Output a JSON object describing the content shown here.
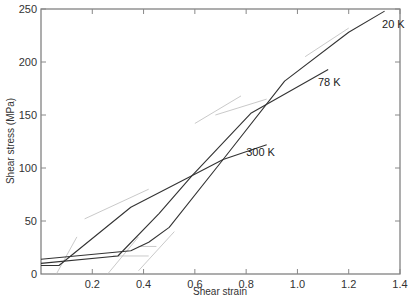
{
  "chart_data": {
    "type": "line",
    "title": "",
    "xlabel": "Shear strain",
    "ylabel": "Shear stress (MPa)",
    "xlim": [
      0,
      1.4
    ],
    "ylim": [
      0,
      250
    ],
    "x_ticks": [
      "0.2",
      "0.4",
      "0.6",
      "0.8",
      "1.0",
      "1.2",
      "1.4"
    ],
    "y_ticks": [
      "0",
      "50",
      "100",
      "150",
      "200",
      "250"
    ],
    "grid": false,
    "legend": "inline labels at line ends",
    "series": [
      {
        "name": "20 K",
        "x": [
          0.0,
          0.35,
          0.42,
          0.5,
          0.71,
          0.95,
          1.2,
          1.34
        ],
        "y": [
          14,
          22,
          30,
          44,
          108,
          182,
          228,
          248
        ]
      },
      {
        "name": "78 K",
        "x": [
          0.0,
          0.3,
          0.46,
          0.59,
          0.82,
          1.12
        ],
        "y": [
          10,
          17,
          57,
          93,
          152,
          193
        ]
      },
      {
        "name": "300 K",
        "x": [
          0.0,
          0.07,
          0.35,
          0.59,
          0.71,
          0.88
        ],
        "y": [
          8,
          8,
          63,
          93,
          108,
          122
        ]
      }
    ],
    "labels": [
      {
        "text": "20 K",
        "x": 1.33,
        "y": 232
      },
      {
        "text": "78 K",
        "x": 1.08,
        "y": 177
      },
      {
        "text": "300 K",
        "x": 0.8,
        "y": 111
      }
    ]
  }
}
